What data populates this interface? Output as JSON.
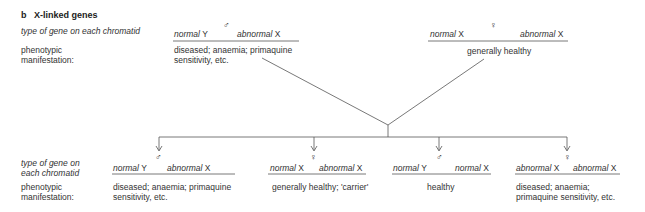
{
  "section": {
    "letter": "b",
    "title": "X-linked genes"
  },
  "parents": {
    "row_label": "type of gene on each chromatid",
    "phenotype_label_1": "phenotypic",
    "phenotype_label_2": "manifestation:",
    "male": {
      "sex_symbol": "♂",
      "left": {
        "allele": "normal",
        "chromosome": "Y"
      },
      "right": {
        "allele": "abnormal",
        "chromosome": "X"
      },
      "phenotype_1": "diseased; anaemia; primaquine",
      "phenotype_2": "sensitivity, etc."
    },
    "female": {
      "sex_symbol": "♀",
      "left": {
        "allele": "normal",
        "chromosome": "X"
      },
      "right": {
        "allele": "abnormal",
        "chromosome": "X"
      },
      "phenotype_1": "generally healthy"
    }
  },
  "offspring": {
    "row_label_1": "type of gene on",
    "row_label_2": "each chromatid",
    "phenotype_label_1": "phenotypic",
    "phenotype_label_2": "manifestation:",
    "children": [
      {
        "sex_symbol": "♂",
        "left": {
          "allele": "normal",
          "chromosome": "Y"
        },
        "right": {
          "allele": "abnormal",
          "chromosome": "X"
        },
        "phenotype_1": "diseased; anaemia; primaquine",
        "phenotype_2": "sensitivity, etc."
      },
      {
        "sex_symbol": "♀",
        "left": {
          "allele": "normal",
          "chromosome": "X"
        },
        "right": {
          "allele": "abnormal",
          "chromosome": "X"
        },
        "phenotype_1": "generally healthy; 'carrier'"
      },
      {
        "sex_symbol": "♂",
        "left": {
          "allele": "normal",
          "chromosome": "Y"
        },
        "right": {
          "allele": "normal",
          "chromosome": "X"
        },
        "phenotype_1": "healthy"
      },
      {
        "sex_symbol": "♀",
        "left": {
          "allele": "abnormal",
          "chromosome": "X"
        },
        "right": {
          "allele": "abnormal",
          "chromosome": "X"
        },
        "phenotype_1": "diseased; anaemia;",
        "phenotype_2": "primaquine sensitivity, etc."
      }
    ]
  }
}
